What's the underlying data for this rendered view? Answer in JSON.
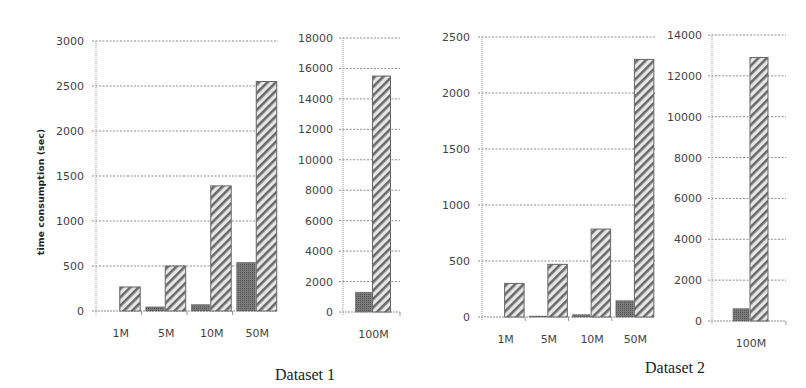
{
  "chart_data": [
    {
      "type": "bar",
      "title": "Dataset 1",
      "ylabel": "time consumption (sec)",
      "panels": [
        {
          "categories": [
            "1M",
            "5M",
            "10M",
            "50M"
          ],
          "ylim": [
            0,
            3000
          ],
          "yticks": [
            0,
            500,
            1000,
            1500,
            2000,
            2500,
            3000
          ],
          "series": [
            {
              "name": "dark",
              "pattern": "dense-dark",
              "values": [
                0,
                45,
                70,
                540
              ]
            },
            {
              "name": "hatched",
              "pattern": "diagonal-hatch",
              "values": [
                267,
                500,
                1390,
                2550
              ]
            }
          ]
        },
        {
          "categories": [
            "100M"
          ],
          "ylim": [
            0,
            18000
          ],
          "yticks": [
            0,
            2000,
            4000,
            6000,
            8000,
            10000,
            12000,
            14000,
            16000,
            18000
          ],
          "series": [
            {
              "name": "dark",
              "pattern": "dense-dark",
              "values": [
                1300
              ]
            },
            {
              "name": "hatched",
              "pattern": "diagonal-hatch",
              "values": [
                15500
              ]
            }
          ]
        }
      ],
      "grid": true
    },
    {
      "type": "bar",
      "title": "Dataset 2",
      "ylabel": "",
      "panels": [
        {
          "categories": [
            "1M",
            "5M",
            "10M",
            "50M"
          ],
          "ylim": [
            0,
            2500
          ],
          "yticks": [
            0,
            500,
            1000,
            1500,
            2000,
            2500
          ],
          "series": [
            {
              "name": "dark",
              "pattern": "dense-dark",
              "values": [
                0,
                8,
                20,
                145
              ]
            },
            {
              "name": "hatched",
              "pattern": "diagonal-hatch",
              "values": [
                300,
                470,
                785,
                2300
              ]
            }
          ]
        },
        {
          "categories": [
            "100M"
          ],
          "ylim": [
            0,
            14000
          ],
          "yticks": [
            0,
            2000,
            4000,
            6000,
            8000,
            10000,
            12000,
            14000
          ],
          "series": [
            {
              "name": "dark",
              "pattern": "dense-dark",
              "values": [
                600
              ]
            },
            {
              "name": "hatched",
              "pattern": "diagonal-hatch",
              "values": [
                12900
              ]
            }
          ]
        }
      ],
      "grid": true
    }
  ]
}
